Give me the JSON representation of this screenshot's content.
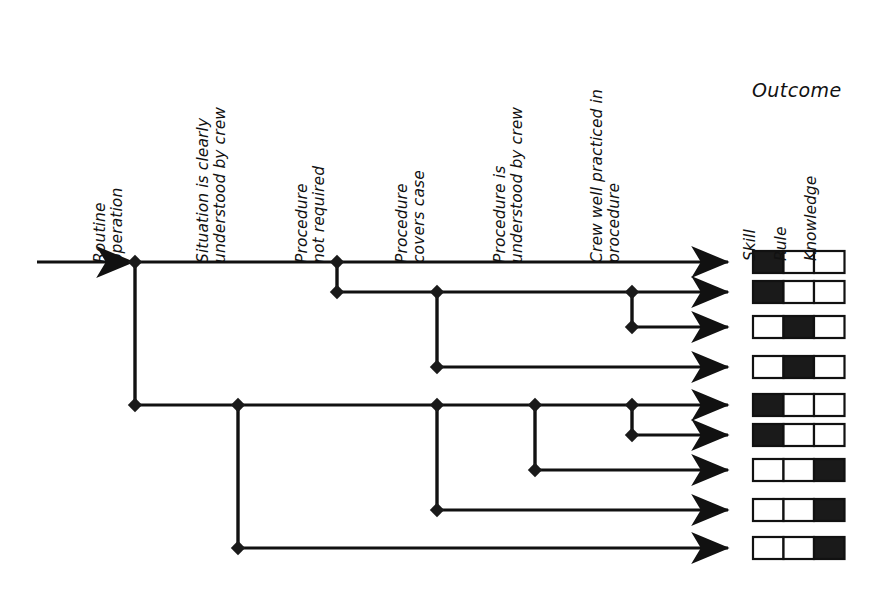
{
  "diagram": {
    "outcome_title": "Outcome",
    "line_color": "#111111",
    "fill_color": "#1a1a1a",
    "columns": [
      {
        "id": "routine-operation",
        "line1": "Routine",
        "line2": "operation",
        "x": 135
      },
      {
        "id": "situation-understood",
        "line1": "Situation is clearly",
        "line2": "understood by crew",
        "x": 238
      },
      {
        "id": "procedure-not-required",
        "line1": "Procedure",
        "line2": "not required",
        "x": 337
      },
      {
        "id": "procedure-covers-case",
        "line1": "Procedure",
        "line2": "covers case",
        "x": 437
      },
      {
        "id": "procedure-understood",
        "line1": "Procedure is",
        "line2": "understood by crew",
        "x": 535
      },
      {
        "id": "crew-well-practiced",
        "line1": "Crew well practiced in",
        "line2": "procedure",
        "x": 632
      }
    ],
    "outcome_columns": [
      {
        "id": "skill",
        "label": "Skill"
      },
      {
        "id": "rule",
        "label": "Rule"
      },
      {
        "id": "knowledge",
        "label": "Knowledge"
      }
    ],
    "rows": [
      {
        "index": 1,
        "y": 262,
        "outcome": "skill",
        "filled": [
          true,
          false,
          false
        ]
      },
      {
        "index": 2,
        "y": 292,
        "outcome": "skill",
        "filled": [
          true,
          false,
          false
        ]
      },
      {
        "index": 3,
        "y": 327,
        "outcome": "rule",
        "filled": [
          false,
          true,
          false
        ]
      },
      {
        "index": 4,
        "y": 367,
        "outcome": "rule",
        "filled": [
          false,
          true,
          false
        ]
      },
      {
        "index": 5,
        "y": 405,
        "outcome": "skill",
        "filled": [
          true,
          false,
          false
        ]
      },
      {
        "index": 6,
        "y": 435,
        "outcome": "skill",
        "filled": [
          true,
          false,
          false
        ]
      },
      {
        "index": 7,
        "y": 470,
        "outcome": "knowledge",
        "filled": [
          false,
          false,
          true
        ]
      },
      {
        "index": 8,
        "y": 510,
        "outcome": "knowledge",
        "filled": [
          false,
          false,
          true
        ]
      },
      {
        "index": 9,
        "y": 548,
        "outcome": "knowledge",
        "filled": [
          false,
          false,
          true
        ]
      }
    ],
    "entry": {
      "x_start": 37,
      "x_end": 135,
      "y": 262
    },
    "arrow_x": 728,
    "box": {
      "x": 753,
      "cell_w": 30.5,
      "h": 22
    },
    "nodes": [
      {
        "id": "root",
        "x": 135,
        "y": 262
      },
      {
        "id": "n-c3-r1",
        "x": 337,
        "y": 262
      },
      {
        "id": "n-c3-r2",
        "x": 337,
        "y": 292
      },
      {
        "id": "n-c4-r2",
        "x": 437,
        "y": 292
      },
      {
        "id": "n-c6-r2",
        "x": 632,
        "y": 292
      },
      {
        "id": "n-c6-r3",
        "x": 632,
        "y": 327
      },
      {
        "id": "n-c4-r4",
        "x": 437,
        "y": 367
      },
      {
        "id": "n-c1-r5",
        "x": 135,
        "y": 405
      },
      {
        "id": "n-c2-r5",
        "x": 238,
        "y": 405
      },
      {
        "id": "n-c4-r5",
        "x": 437,
        "y": 405
      },
      {
        "id": "n-c5-r5",
        "x": 535,
        "y": 405
      },
      {
        "id": "n-c6-r5",
        "x": 632,
        "y": 405
      },
      {
        "id": "n-c6-r6",
        "x": 632,
        "y": 435
      },
      {
        "id": "n-c5-r7",
        "x": 535,
        "y": 470
      },
      {
        "id": "n-c4-r8",
        "x": 437,
        "y": 510
      },
      {
        "id": "n-c2-r9",
        "x": 238,
        "y": 548
      }
    ],
    "branches": [
      {
        "id": "b-root-down",
        "x": 135,
        "y1": 262,
        "y2": 405
      },
      {
        "id": "b-c3-down",
        "x": 337,
        "y1": 262,
        "y2": 292
      },
      {
        "id": "b-c4-down-r2",
        "x": 437,
        "y1": 292,
        "y2": 367
      },
      {
        "id": "b-c6-down-r2",
        "x": 632,
        "y1": 292,
        "y2": 327
      },
      {
        "id": "b-c2-down",
        "x": 238,
        "y1": 405,
        "y2": 548
      },
      {
        "id": "b-c4-down-r5",
        "x": 437,
        "y1": 405,
        "y2": 510
      },
      {
        "id": "b-c5-down-r5",
        "x": 535,
        "y1": 405,
        "y2": 470
      },
      {
        "id": "b-c6-down-r5",
        "x": 632,
        "y1": 405,
        "y2": 435
      }
    ],
    "rails": [
      {
        "id": "rail-r1",
        "x1": 135,
        "x2": 728,
        "y": 262
      },
      {
        "id": "rail-r2",
        "x1": 337,
        "x2": 728,
        "y": 292
      },
      {
        "id": "rail-r3",
        "x1": 632,
        "x2": 728,
        "y": 327
      },
      {
        "id": "rail-r4",
        "x1": 437,
        "x2": 728,
        "y": 367
      },
      {
        "id": "rail-r5",
        "x1": 135,
        "x2": 728,
        "y": 405
      },
      {
        "id": "rail-r6",
        "x1": 632,
        "x2": 728,
        "y": 435
      },
      {
        "id": "rail-r7",
        "x1": 535,
        "x2": 728,
        "y": 470
      },
      {
        "id": "rail-r8",
        "x1": 437,
        "x2": 728,
        "y": 510
      },
      {
        "id": "rail-r9",
        "x1": 238,
        "x2": 728,
        "y": 548
      }
    ]
  }
}
